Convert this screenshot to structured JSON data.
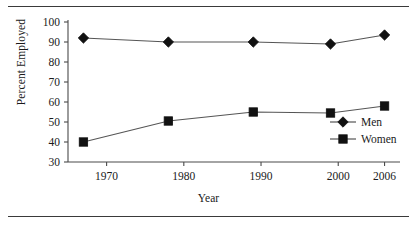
{
  "figure": {
    "top_rule": "horizontal-rule",
    "bottom_rule": "horizontal-rule"
  },
  "chart_data": {
    "type": "line",
    "title": "",
    "xlabel": "Year",
    "ylabel": "Percent Employed",
    "x": [
      1967,
      1978,
      1989,
      1999,
      2006
    ],
    "xtick_labels": [
      "1970",
      "1980",
      "1990",
      "2000",
      "2006"
    ],
    "xtick_values": [
      1970,
      1980,
      1990,
      2000,
      2006
    ],
    "ytick_labels": [
      "30",
      "40",
      "50",
      "60",
      "70",
      "80",
      "90",
      "100"
    ],
    "ytick_values": [
      30,
      40,
      50,
      60,
      70,
      80,
      90,
      100
    ],
    "xlim": [
      1965,
      2008
    ],
    "ylim": [
      30,
      100
    ],
    "grid": false,
    "legend_position": "lower-right-inside",
    "series": [
      {
        "name": "Men",
        "marker": "diamond",
        "color": "#111111",
        "values": [
          92,
          90,
          90,
          89,
          93.5
        ]
      },
      {
        "name": "Women",
        "marker": "square",
        "color": "#111111",
        "values": [
          40,
          50.5,
          55,
          54.5,
          58
        ]
      }
    ]
  }
}
